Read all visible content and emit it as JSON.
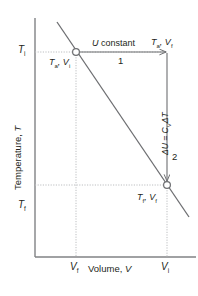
{
  "figure": {
    "kind": "thermodynamics-process-diagram",
    "background_color": "#ffffff",
    "line_color": "#6d6e71",
    "axis_color": "#808285",
    "text_color": "#231f20",
    "guide_color": "#bcbec0"
  },
  "axes": {
    "y": {
      "title": "Temperature, T",
      "title_variable": "T",
      "title_prefix": "Temperature, ",
      "ticks": [
        {
          "label": "T",
          "sub": "i",
          "position_px": 52
        },
        {
          "label": "T",
          "sub": "f",
          "position_px": 207
        }
      ]
    },
    "x": {
      "title": "Volume, V",
      "title_variable": "V",
      "title_prefix": "Volume, ",
      "ticks": [
        {
          "label": "V",
          "sub": "f",
          "position_px": 76
        },
        {
          "label": "V",
          "sub": "i",
          "position_px": 167
        }
      ]
    }
  },
  "curve": {
    "name": "isotherm-line",
    "description": "straight descending line"
  },
  "points": [
    {
      "name": "initial-state",
      "marker": "open-circle",
      "label_var1": "T",
      "label_sub1": "a",
      "label_var2": "V",
      "label_sub2": "i"
    },
    {
      "name": "final-state",
      "marker": "open-circle",
      "label_var1": "T",
      "label_sub1": "f",
      "label_var2": "V",
      "label_sub2": "f"
    }
  ],
  "paths": {
    "step1": {
      "number": "1",
      "annotation_variable": "U",
      "annotation_text": " constant",
      "end_label_var1": "T",
      "end_label_sub1": "a",
      "end_label_var2": "V",
      "end_label_sub2": "f"
    },
    "step2": {
      "number": "2",
      "annotation_delta": "ΔU = C",
      "annotation_sub": "V",
      "annotation_tail": "ΔT"
    }
  }
}
